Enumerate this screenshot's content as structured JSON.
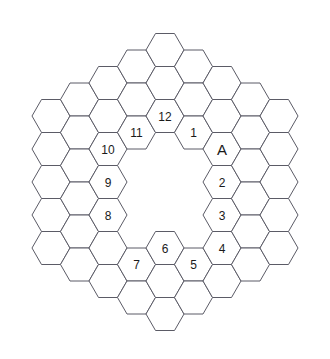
{
  "diagram": {
    "type": "hex-grid-annulus",
    "orientation": "flat-top",
    "stroke_color": "#5b5b66",
    "fill_color": "#ffffff",
    "label_color": "#1a1a1a",
    "background": "#ffffff",
    "geometry": {
      "hex_width": 38,
      "hex_height": 33,
      "col_pitch": 28.5,
      "row_pitch": 33,
      "center_x": 165,
      "center_y": 182,
      "outer_radius_rings": 4,
      "inner_hole_rings": 2
    },
    "cells": [
      {
        "q": -4,
        "r": 0,
        "label": ""
      },
      {
        "q": -4,
        "r": 1,
        "label": ""
      },
      {
        "q": -4,
        "r": 2,
        "label": ""
      },
      {
        "q": -4,
        "r": 3,
        "label": ""
      },
      {
        "q": -4,
        "r": 4,
        "label": ""
      },
      {
        "q": -3,
        "r": -1,
        "label": ""
      },
      {
        "q": -3,
        "r": 0,
        "label": ""
      },
      {
        "q": -3,
        "r": 1,
        "label": ""
      },
      {
        "q": -3,
        "r": 2,
        "label": ""
      },
      {
        "q": -3,
        "r": 3,
        "label": ""
      },
      {
        "q": -3,
        "r": 4,
        "label": ""
      },
      {
        "q": -2,
        "r": -2,
        "label": ""
      },
      {
        "q": -2,
        "r": -1,
        "label": ""
      },
      {
        "q": -2,
        "r": 0,
        "label": "10"
      },
      {
        "q": -2,
        "r": 1,
        "label": "9"
      },
      {
        "q": -2,
        "r": 2,
        "label": "8"
      },
      {
        "q": -2,
        "r": 3,
        "label": ""
      },
      {
        "q": -2,
        "r": 4,
        "label": ""
      },
      {
        "q": -1,
        "r": -3,
        "label": ""
      },
      {
        "q": -1,
        "r": -2,
        "label": ""
      },
      {
        "q": -1,
        "r": -1,
        "label": "11"
      },
      {
        "q": -1,
        "r": 3,
        "label": "7"
      },
      {
        "q": -1,
        "r": 4,
        "label": ""
      },
      {
        "q": 0,
        "r": -4,
        "label": ""
      },
      {
        "q": 0,
        "r": -3,
        "label": ""
      },
      {
        "q": 0,
        "r": -2,
        "label": "12"
      },
      {
        "q": 0,
        "r": 2,
        "label": "6"
      },
      {
        "q": 0,
        "r": 3,
        "label": ""
      },
      {
        "q": 0,
        "r": 4,
        "label": ""
      },
      {
        "q": 1,
        "r": -4,
        "label": ""
      },
      {
        "q": 1,
        "r": -3,
        "label": ""
      },
      {
        "q": 1,
        "r": -2,
        "label": "1"
      },
      {
        "q": 1,
        "r": 2,
        "label": "5"
      },
      {
        "q": 1,
        "r": 3,
        "label": ""
      },
      {
        "q": 2,
        "r": -4,
        "label": ""
      },
      {
        "q": 2,
        "r": -3,
        "label": ""
      },
      {
        "q": 2,
        "r": -2,
        "label": "A"
      },
      {
        "q": 2,
        "r": -1,
        "label": "2"
      },
      {
        "q": 2,
        "r": 0,
        "label": "3"
      },
      {
        "q": 2,
        "r": 1,
        "label": "4"
      },
      {
        "q": 2,
        "r": 2,
        "label": ""
      },
      {
        "q": 3,
        "r": -4,
        "label": ""
      },
      {
        "q": 3,
        "r": -3,
        "label": ""
      },
      {
        "q": 3,
        "r": -2,
        "label": ""
      },
      {
        "q": 3,
        "r": -1,
        "label": ""
      },
      {
        "q": 3,
        "r": 0,
        "label": ""
      },
      {
        "q": 3,
        "r": 1,
        "label": ""
      },
      {
        "q": 4,
        "r": -4,
        "label": ""
      },
      {
        "q": 4,
        "r": -3,
        "label": ""
      },
      {
        "q": 4,
        "r": -2,
        "label": ""
      },
      {
        "q": 4,
        "r": -1,
        "label": ""
      },
      {
        "q": 4,
        "r": 0,
        "label": ""
      }
    ],
    "labels_in_order": [
      "A",
      "1",
      "2",
      "3",
      "4",
      "5",
      "6",
      "7",
      "8",
      "9",
      "10",
      "11",
      "12"
    ]
  }
}
